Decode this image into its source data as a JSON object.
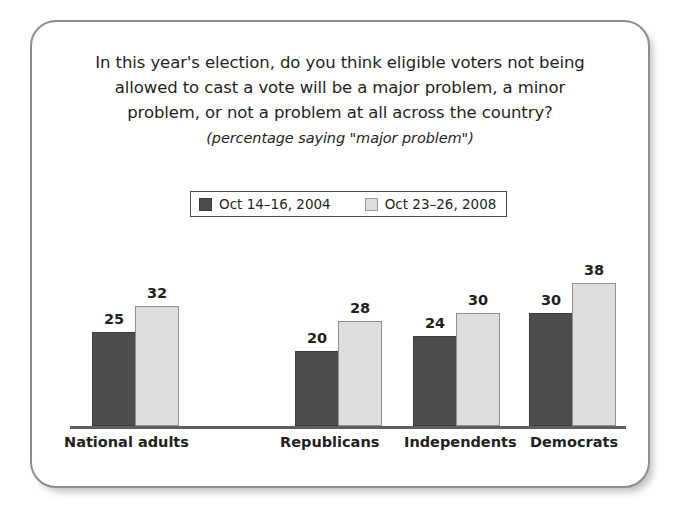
{
  "chart_data": {
    "type": "bar",
    "title": "In this year's election, do you think eligible voters not being allowed to cast a vote will be a major problem, a minor problem, or not a problem at all across the country?",
    "title_lines": [
      "In this year's election, do you think eligible voters not being",
      "allowed to cast a vote will be a major problem, a minor",
      "problem, or not a problem at all across the country?"
    ],
    "subtitle": "(percentage saying \"major problem\")",
    "categories": [
      "National adults",
      "Republicans",
      "Independents",
      "Democrats"
    ],
    "series": [
      {
        "name": "Oct 14-16, 2004",
        "values": [
          25,
          20,
          24,
          30
        ],
        "color": "#4d4d4d"
      },
      {
        "name": "Oct 23-26, 2008",
        "values": [
          32,
          28,
          30,
          38
        ],
        "color": "#dedede"
      }
    ],
    "legend": {
      "position": "top-center",
      "entries": [
        {
          "label": "Oct 14–16, 2004",
          "swatch": "dark"
        },
        {
          "label": "Oct 23–26, 2008",
          "swatch": "light"
        }
      ]
    },
    "xlabel": "",
    "ylabel": "",
    "ylim": [
      0,
      42
    ],
    "grid": false,
    "value_labels": true
  },
  "bars": [
    {
      "name": "national-adults-2004",
      "value": "25",
      "left": 60,
      "width": 44,
      "height": 94,
      "tone": "dark"
    },
    {
      "name": "national-adults-2008",
      "value": "32",
      "left": 103,
      "width": 44,
      "height": 120,
      "tone": "light"
    },
    {
      "name": "republicans-2004",
      "value": "20",
      "left": 263,
      "width": 44,
      "height": 75,
      "tone": "dark"
    },
    {
      "name": "republicans-2008",
      "value": "28",
      "left": 306,
      "width": 44,
      "height": 105,
      "tone": "light"
    },
    {
      "name": "independents-2004",
      "value": "24",
      "left": 381,
      "width": 44,
      "height": 90,
      "tone": "dark"
    },
    {
      "name": "independents-2008",
      "value": "30",
      "left": 424,
      "width": 44,
      "height": 113,
      "tone": "light"
    },
    {
      "name": "democrats-2004",
      "value": "30",
      "left": 497,
      "width": 44,
      "height": 113,
      "tone": "dark"
    },
    {
      "name": "democrats-2008",
      "value": "38",
      "left": 540,
      "width": 44,
      "height": 143,
      "tone": "light"
    }
  ],
  "category_labels": [
    {
      "text": "National adults",
      "left": 32
    },
    {
      "text": "Republicans",
      "left": 248
    },
    {
      "text": "Independents",
      "left": 372
    },
    {
      "text": "Democrats",
      "left": 498
    }
  ]
}
